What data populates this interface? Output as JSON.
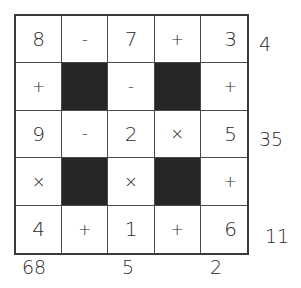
{
  "puzzle": {
    "rows": 5,
    "cols": 5,
    "cells": [
      [
        "8",
        "-",
        "7",
        "+",
        "3"
      ],
      [
        "+",
        "#",
        "-",
        "#",
        "+"
      ],
      [
        "9",
        "-",
        "2",
        "×",
        "5"
      ],
      [
        "×",
        "#",
        "×",
        "#",
        "+"
      ],
      [
        "4",
        "+",
        "1",
        "+",
        "6"
      ]
    ],
    "row_results": [
      "4",
      "",
      "35",
      "",
      "11"
    ],
    "col_results": [
      "68",
      "",
      "5",
      "",
      "2"
    ],
    "colors": {
      "block": "#262626",
      "line": "#3a3a3a",
      "background": "#ffffff"
    }
  }
}
